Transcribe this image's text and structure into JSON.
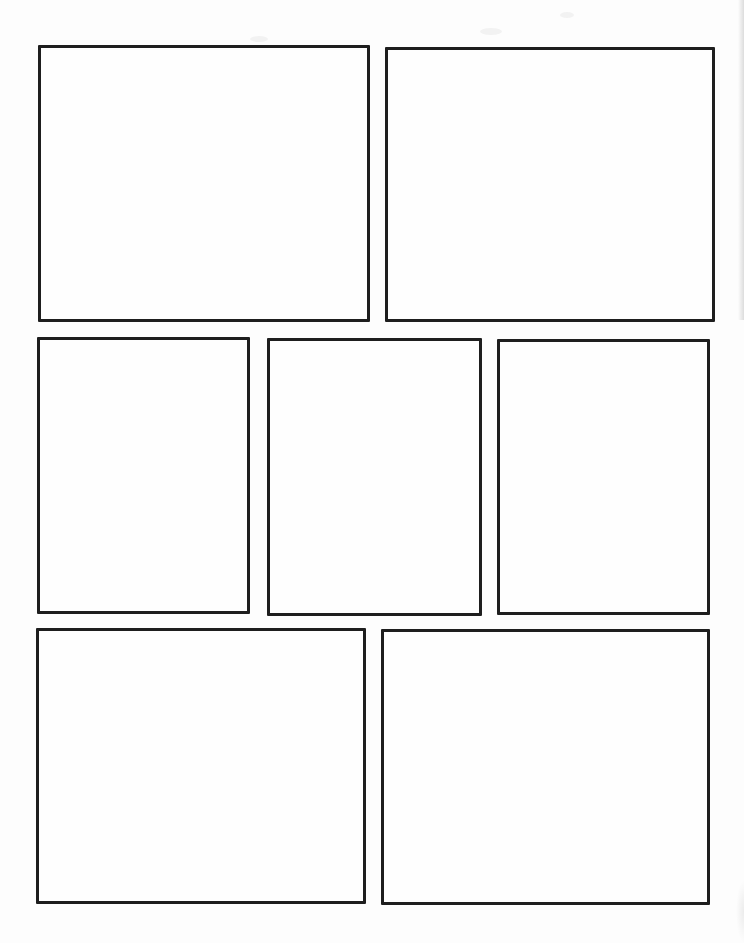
{
  "document": {
    "kind": "blank-comic-page-template",
    "panel_count": 7
  },
  "colors": {
    "page_background": "#fdfdfd",
    "panel_border": "#1e1e1e",
    "panel_fill": "#fefefe",
    "scan_shadow": "#c9c9c9"
  },
  "rows": [
    {
      "name": "row-1",
      "panels": [
        {
          "name": "panel-1",
          "content": ""
        },
        {
          "name": "panel-2",
          "content": ""
        }
      ]
    },
    {
      "name": "row-2",
      "panels": [
        {
          "name": "panel-3",
          "content": ""
        },
        {
          "name": "panel-4",
          "content": ""
        },
        {
          "name": "panel-5",
          "content": ""
        }
      ]
    },
    {
      "name": "row-3",
      "panels": [
        {
          "name": "panel-6",
          "content": ""
        },
        {
          "name": "panel-7",
          "content": ""
        }
      ]
    }
  ]
}
